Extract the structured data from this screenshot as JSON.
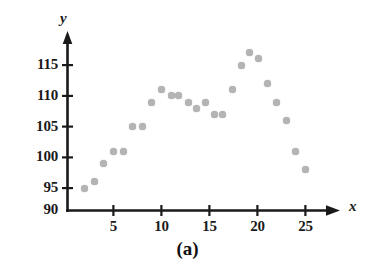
{
  "figure": {
    "caption": "(a)",
    "axis_titles": {
      "x": "x",
      "y": "y"
    },
    "ink_color": "#1a1a1a",
    "marker_color": "#b4b4b4"
  },
  "chart_data": {
    "type": "scatter",
    "title": "",
    "xlabel": "x",
    "ylabel": "y",
    "xlim": [
      0,
      26.5
    ],
    "ylim": [
      90,
      118.5
    ],
    "xticks": [
      5,
      10,
      15,
      20,
      25
    ],
    "yticks": [
      90,
      95,
      100,
      105,
      110,
      115
    ],
    "xtick_labels": [
      "5",
      "10",
      "15",
      "20",
      "25"
    ],
    "ytick_labels": [
      "90",
      "95",
      "100",
      "105",
      "110",
      "115"
    ],
    "grid": false,
    "legend": null,
    "annotations": [
      "(a)"
    ],
    "points": [
      {
        "x": 2,
        "y": 95
      },
      {
        "x": 3,
        "y": 96
      },
      {
        "x": 4,
        "y": 99
      },
      {
        "x": 5,
        "y": 101
      },
      {
        "x": 6,
        "y": 101
      },
      {
        "x": 7,
        "y": 105
      },
      {
        "x": 8,
        "y": 105
      },
      {
        "x": 9,
        "y": 109
      },
      {
        "x": 10,
        "y": 111
      },
      {
        "x": 11,
        "y": 110
      },
      {
        "x": 11.8,
        "y": 110
      },
      {
        "x": 12.8,
        "y": 109
      },
      {
        "x": 13.7,
        "y": 108
      },
      {
        "x": 14.6,
        "y": 109
      },
      {
        "x": 15.5,
        "y": 107
      },
      {
        "x": 16.4,
        "y": 107
      },
      {
        "x": 17.4,
        "y": 111
      },
      {
        "x": 18.3,
        "y": 115
      },
      {
        "x": 19.2,
        "y": 117
      },
      {
        "x": 20.1,
        "y": 116
      },
      {
        "x": 21.1,
        "y": 112
      },
      {
        "x": 22,
        "y": 109
      },
      {
        "x": 23,
        "y": 106
      },
      {
        "x": 24,
        "y": 101
      },
      {
        "x": 25,
        "y": 98
      }
    ]
  }
}
